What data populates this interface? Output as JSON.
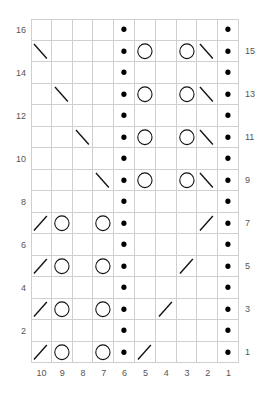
{
  "chart_title": "",
  "grid": {
    "columns": 10,
    "rows": 16,
    "line_color": "#cfcfcf",
    "symbol_color": "#000000"
  },
  "column_labels": [
    "10",
    "9",
    "8",
    "7",
    "6",
    "5",
    "4",
    "3",
    "2",
    "1"
  ],
  "row_labels_left": [
    "16",
    "14",
    "12",
    "10",
    "8",
    "6",
    "4",
    "2"
  ],
  "row_labels_right": [
    "15",
    "13",
    "11",
    "9",
    "7",
    "5",
    "3",
    "1"
  ],
  "legend_symbols": {
    "dot": "purl (dot)",
    "circle": "yarn over (circle)",
    "backslash": "left-leaning decrease (\\)",
    "slash": "right-leaning decrease (/)"
  },
  "rows": [
    {
      "row": 16,
      "cells": [
        "",
        "",
        "",
        "",
        "dot",
        "",
        "",
        "",
        "",
        "dot"
      ]
    },
    {
      "row": 15,
      "cells": [
        "backslash",
        "",
        "",
        "",
        "dot",
        "circle",
        "",
        "circle",
        "backslash",
        "dot"
      ]
    },
    {
      "row": 14,
      "cells": [
        "",
        "",
        "",
        "",
        "dot",
        "",
        "",
        "",
        "",
        "dot"
      ]
    },
    {
      "row": 13,
      "cells": [
        "",
        "backslash",
        "",
        "",
        "dot",
        "circle",
        "",
        "circle",
        "backslash",
        "dot"
      ]
    },
    {
      "row": 12,
      "cells": [
        "",
        "",
        "",
        "",
        "dot",
        "",
        "",
        "",
        "",
        "dot"
      ]
    },
    {
      "row": 11,
      "cells": [
        "",
        "",
        "backslash",
        "",
        "dot",
        "circle",
        "",
        "circle",
        "backslash",
        "dot"
      ]
    },
    {
      "row": 10,
      "cells": [
        "",
        "",
        "",
        "",
        "dot",
        "",
        "",
        "",
        "",
        "dot"
      ]
    },
    {
      "row": 9,
      "cells": [
        "",
        "",
        "",
        "backslash",
        "dot",
        "circle",
        "",
        "circle",
        "backslash",
        "dot"
      ]
    },
    {
      "row": 8,
      "cells": [
        "",
        "",
        "",
        "",
        "dot",
        "",
        "",
        "",
        "",
        "dot"
      ]
    },
    {
      "row": 7,
      "cells": [
        "slash",
        "circle",
        "",
        "circle",
        "dot",
        "",
        "",
        "",
        "slash",
        "dot"
      ]
    },
    {
      "row": 6,
      "cells": [
        "",
        "",
        "",
        "",
        "dot",
        "",
        "",
        "",
        "",
        "dot"
      ]
    },
    {
      "row": 5,
      "cells": [
        "slash",
        "circle",
        "",
        "circle",
        "dot",
        "",
        "",
        "slash",
        "",
        "dot"
      ]
    },
    {
      "row": 4,
      "cells": [
        "",
        "",
        "",
        "",
        "dot",
        "",
        "",
        "",
        "",
        "dot"
      ]
    },
    {
      "row": 3,
      "cells": [
        "slash",
        "circle",
        "",
        "circle",
        "dot",
        "",
        "slash",
        "",
        "",
        "dot"
      ]
    },
    {
      "row": 2,
      "cells": [
        "",
        "",
        "",
        "",
        "dot",
        "",
        "",
        "",
        "",
        "dot"
      ]
    },
    {
      "row": 1,
      "cells": [
        "slash",
        "circle",
        "",
        "circle",
        "dot",
        "slash",
        "",
        "",
        "",
        "dot"
      ]
    }
  ]
}
